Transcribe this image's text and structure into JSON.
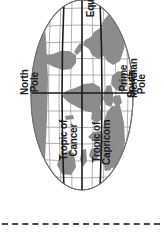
{
  "figure": {
    "kind": "world-map-diagram",
    "orientation_degrees": 90,
    "background_color": "#ffffff",
    "land_color": "#8c8c8c",
    "ocean_color": "#ffffff",
    "graticule_color": "#8f8f8f",
    "reference_line_color": "#1b1b1b",
    "label_color": "#1b1b1b",
    "outline_color": "#6e6e6e"
  },
  "labels": {
    "equator": "Equator",
    "north_pole": "North\nPole",
    "south_pole": "South\nPole",
    "prime_meridian": "Prime\nMeridian",
    "tropic_of_cancer": "Tropic of\nCancer",
    "tropic_of_capricorn": "Tropic of\nCapricorn"
  },
  "reference_lines": [
    {
      "name": "Equator",
      "type": "latitude",
      "degrees": 0
    },
    {
      "name": "Tropic of Cancer",
      "type": "latitude",
      "degrees": 23.5
    },
    {
      "name": "Tropic of Capricorn",
      "type": "latitude",
      "degrees": -23.5
    },
    {
      "name": "Prime Meridian",
      "type": "longitude",
      "degrees": 0
    }
  ],
  "poles": [
    {
      "name": "North Pole",
      "latitude": 90
    },
    {
      "name": "South Pole",
      "latitude": -90
    }
  ],
  "separator": {
    "style": "dashed",
    "color": "#4a4a4a"
  }
}
